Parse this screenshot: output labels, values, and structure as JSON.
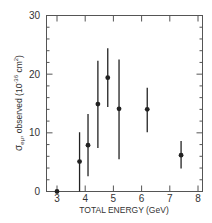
{
  "chart_data": {
    "type": "scatter",
    "title": "",
    "xlabel": "TOTAL ENERGY (GeV)",
    "ylabel": "σ_eμ, observed (10^-36 cm^2)",
    "ylabel_parts": {
      "sigma": "σ",
      "sub": "eμ",
      "rest": ", observed (10",
      "exp": "-36",
      "unit": " cm",
      "unit_exp": "2",
      "close": ")"
    },
    "xlim": [
      2.6,
      8.15
    ],
    "ylim": [
      0,
      30
    ],
    "xticks": [
      3,
      4,
      5,
      6,
      7,
      8
    ],
    "yticks": [
      0,
      10,
      20,
      30
    ],
    "minor_ytick_step": 2,
    "grid": false,
    "legend": null,
    "points": [
      {
        "x": 3.0,
        "y": 0.0,
        "err_low": 0.0,
        "err_high": 0.0
      },
      {
        "x": 3.8,
        "y": 5.1,
        "err_low": 0.0,
        "err_high": 10.1
      },
      {
        "x": 4.1,
        "y": 7.9,
        "err_low": 2.6,
        "err_high": 13.2
      },
      {
        "x": 4.45,
        "y": 14.9,
        "err_low": 7.4,
        "err_high": 22.3
      },
      {
        "x": 4.8,
        "y": 19.4,
        "err_low": 14.4,
        "err_high": 24.4
      },
      {
        "x": 5.2,
        "y": 14.1,
        "err_low": 5.5,
        "err_high": 22.5
      },
      {
        "x": 6.2,
        "y": 14.0,
        "err_low": 10.1,
        "err_high": 17.7
      },
      {
        "x": 7.4,
        "y": 6.2,
        "err_low": 3.9,
        "err_high": 8.6
      }
    ],
    "colors": {
      "ink": "#222222",
      "background": "#ffffff"
    }
  }
}
